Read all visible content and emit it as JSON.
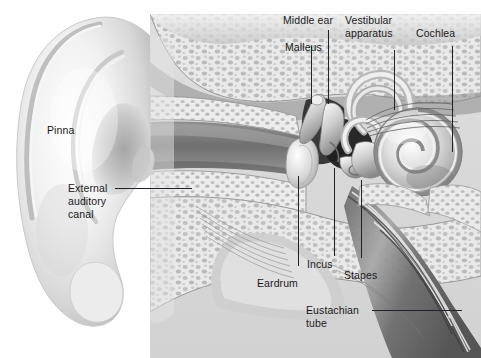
{
  "figure": {
    "style": "grayscale medical illustration",
    "width": 481,
    "height": 358,
    "background_color": "#ffffff",
    "panel_color": "#d9d9d9",
    "label_color": "#1a1a1a",
    "leader_color": "#20242a"
  },
  "labels": {
    "middle_ear": "Middle ear",
    "vestibular_apparatus_line1": "Vestibular",
    "vestibular_apparatus_line2": "apparatus",
    "cochlea": "Cochlea",
    "malleus": "Malleus",
    "pinna": "Pinna",
    "external_line1": "External",
    "external_line2": "auditory",
    "external_line3": "canal",
    "eardrum": "Eardrum",
    "incus": "Incus",
    "stapes": "Stapes",
    "eustachian_line1": "Eustachian",
    "eustachian_line2": "tube"
  },
  "parts": [
    {
      "name": "Pinna",
      "region": "outer ear"
    },
    {
      "name": "External auditory canal",
      "region": "outer ear"
    },
    {
      "name": "Eardrum",
      "region": "boundary"
    },
    {
      "name": "Malleus",
      "region": "middle ear"
    },
    {
      "name": "Incus",
      "region": "middle ear"
    },
    {
      "name": "Stapes",
      "region": "middle ear"
    },
    {
      "name": "Middle ear",
      "region": "middle ear"
    },
    {
      "name": "Eustachian tube",
      "region": "middle ear"
    },
    {
      "name": "Vestibular apparatus",
      "region": "inner ear"
    },
    {
      "name": "Cochlea",
      "region": "inner ear"
    }
  ]
}
